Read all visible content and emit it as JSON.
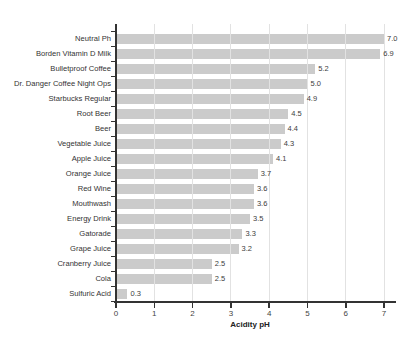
{
  "chart_data": {
    "type": "bar",
    "orientation": "horizontal",
    "title": "",
    "xlabel": "Acidity pH",
    "xlim": [
      0,
      7
    ],
    "xticks": [
      0,
      1,
      2,
      3,
      4,
      5,
      6,
      7
    ],
    "xtick_labels": [
      "0",
      "1",
      "2",
      "3",
      "4",
      "5",
      "6",
      "7"
    ],
    "grid": "vertical",
    "legend": "none",
    "categories": [
      "Neutral Ph",
      "Borden Vitamin D Milk",
      "Bulletproof Coffee",
      "Dr. Danger Coffee Night Ops",
      "Starbucks Regular",
      "Root Beer",
      "Beer",
      "Vegetable Juice",
      "Apple Juice",
      "Orange Juice",
      "Red Wine",
      "Mouthwash",
      "Energy Drink",
      "Gatorade",
      "Grape Juice",
      "Cranberry Juice",
      "Cola",
      "Sulfuric Acid"
    ],
    "values": [
      7.0,
      6.9,
      5.2,
      5.0,
      4.9,
      4.5,
      4.4,
      4.3,
      4.1,
      3.7,
      3.6,
      3.6,
      3.5,
      3.3,
      3.2,
      2.5,
      2.5,
      0.3
    ],
    "value_labels": [
      "7.0",
      "6.9",
      "5.2",
      "5.0",
      "4.9",
      "4.5",
      "4.4",
      "4.3",
      "4.1",
      "3.7",
      "3.6",
      "3.6",
      "3.5",
      "3.3",
      "3.2",
      "2.5",
      "2.5",
      "0.3"
    ],
    "colors": {
      "bar": "#cbcbcb",
      "gridline": "#e2e2e2",
      "axis": "#333333",
      "category_text": "#333333",
      "value_text": "#3d3d3d",
      "tick_text": "#444444",
      "background": "#ffffff"
    }
  }
}
